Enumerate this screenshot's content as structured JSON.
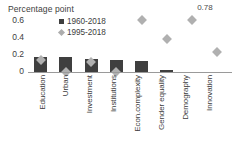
{
  "chart_data": {
    "type": "bar",
    "title": "Percentage point",
    "xlabel": "",
    "ylabel": "Percentage point",
    "ylim": [
      0,
      0.6
    ],
    "yticks": [
      "0.6",
      "0.4",
      "0.2",
      "0"
    ],
    "grid": false,
    "legend_position": "top-left-inside",
    "categories": [
      "Education",
      "Urban",
      "Investment",
      "Institutions",
      "Econ.complexity",
      "Gender equality",
      "Demography",
      "Innovation"
    ],
    "series": [
      {
        "name": "1960-2018",
        "type": "bar",
        "color": "#3f3f3f",
        "marker": "square",
        "values": [
          0.17,
          0.17,
          0.155,
          0.135,
          0.13,
          0.02,
          0.0,
          0.0
        ]
      },
      {
        "name": "1995-2018",
        "type": "scatter",
        "color": "#b0b0b0",
        "marker": "diamond",
        "values": [
          0.135,
          0.0,
          0.12,
          0.0,
          0.6,
          0.38,
          0.78,
          0.23
        ]
      }
    ],
    "annotations": [
      {
        "text": "0.78",
        "series": "1995-2018",
        "category": "Demography"
      }
    ]
  },
  "legend": {
    "items": [
      {
        "label": "1960-2018",
        "marker": "square"
      },
      {
        "label": "1995-2018",
        "marker": "diamond"
      }
    ]
  }
}
